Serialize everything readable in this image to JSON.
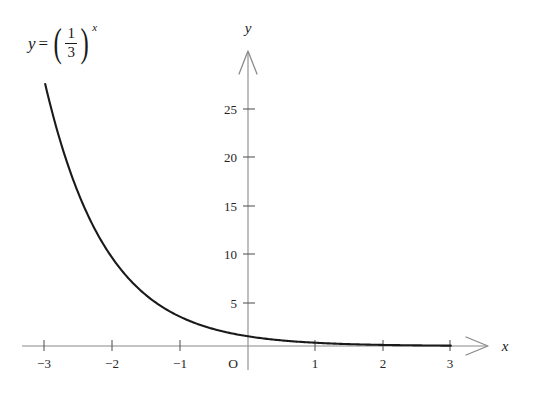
{
  "figure": {
    "name": "exponential-decay-graph",
    "background_color": "#ffffff",
    "curve_color": "#1a1a1a",
    "axis_color": "#8a8a8a"
  },
  "formula": {
    "lhs": "y",
    "equals": "=",
    "numerator": "1",
    "denominator": "3",
    "exponent": "x",
    "paren_open": "(",
    "paren_close": ")",
    "plain": "y = (1/3)^x"
  },
  "axes": {
    "x_label": "x",
    "y_label": "y",
    "origin_label": "O"
  },
  "chart_data": {
    "type": "line",
    "title": "",
    "subtitle": "",
    "xlabel": "x",
    "ylabel": "y",
    "annotations": [
      {
        "text": "y = (1/3)^x",
        "x": -2.6,
        "y": 30
      }
    ],
    "legend": [],
    "legend_position": "none",
    "grid": false,
    "xlim": [
      -3.3,
      3.3
    ],
    "ylim": [
      0,
      29
    ],
    "xticks": [
      -3,
      -2,
      -1,
      1,
      2,
      3
    ],
    "xtick_labels": [
      "−3",
      "−2",
      "−1",
      "1",
      "2",
      "3"
    ],
    "yticks": [
      5,
      10,
      15,
      20,
      25
    ],
    "ytick_labels": [
      "5",
      "10",
      "15",
      "20",
      "25"
    ],
    "series": [
      {
        "name": "y = (1/3)^x",
        "formula": "y = (1/3)^x",
        "color": "#1a1a1a",
        "x": [
          -3,
          -2.75,
          -2.5,
          -2.25,
          -2,
          -1.75,
          -1.5,
          -1.25,
          -1,
          -0.75,
          -0.5,
          -0.25,
          0,
          0.25,
          0.5,
          0.75,
          1,
          1.5,
          2,
          2.5,
          3
        ],
        "y": [
          27,
          20.52,
          15.59,
          11.84,
          9,
          6.84,
          5.196,
          3.948,
          3,
          2.28,
          1.732,
          1.316,
          1,
          0.76,
          0.577,
          0.439,
          0.333,
          0.192,
          0.111,
          0.064,
          0.037
        ]
      }
    ]
  }
}
